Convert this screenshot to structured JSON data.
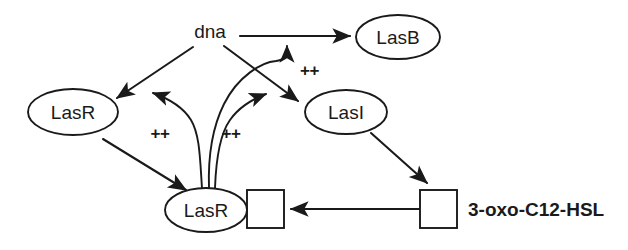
{
  "diagram": {
    "nodes": [
      {
        "id": "dna",
        "label": "dna",
        "shape": "text",
        "cx": 210,
        "cy": 31
      },
      {
        "id": "lasb",
        "label": "LasB",
        "shape": "ellipse",
        "cx": 398,
        "cy": 37
      },
      {
        "id": "lasr",
        "label": "LasR",
        "shape": "ellipse",
        "cx": 73,
        "cy": 112
      },
      {
        "id": "lasi",
        "label": "LasI",
        "shape": "ellipse",
        "cx": 346,
        "cy": 112
      },
      {
        "id": "lasr_complex",
        "label": "LasR",
        "shape": "ellipse-square",
        "cx": 206,
        "cy": 210
      },
      {
        "id": "hsl",
        "label": "3-oxo-C12-HSL",
        "shape": "square-label",
        "cx": 438,
        "cy": 209
      }
    ],
    "annotations": [
      {
        "id": "plus-dna",
        "label": "++",
        "x": 300,
        "y": 70
      },
      {
        "id": "plus-lasr",
        "label": "++",
        "x": 160,
        "y": 133
      },
      {
        "id": "plus-lasi",
        "label": "++",
        "x": 231,
        "y": 133
      }
    ],
    "edges": [
      {
        "id": "dna-to-lasb",
        "from": "dna",
        "to": "lasb",
        "kind": "straight-arrow"
      },
      {
        "id": "dna-to-lasr",
        "from": "dna",
        "to": "lasr",
        "kind": "straight-arrow"
      },
      {
        "id": "dna-to-lasi",
        "from": "dna",
        "to": "lasi",
        "kind": "straight-arrow"
      },
      {
        "id": "lasr-to-lasr-complex",
        "from": "lasr",
        "to": "lasr_complex",
        "kind": "straight-arrow"
      },
      {
        "id": "lasi-to-hsl",
        "from": "lasi",
        "to": "hsl",
        "kind": "straight-arrow"
      },
      {
        "id": "hsl-to-lasr-complex",
        "from": "hsl",
        "to": "lasr_complex",
        "kind": "straight-arrow"
      },
      {
        "id": "complex-activates-lasr",
        "from": "lasr_complex",
        "to": "lasr",
        "kind": "curved-arrow",
        "label": "++"
      },
      {
        "id": "complex-activates-dna",
        "from": "lasr_complex",
        "to": "dna",
        "kind": "curved-arrow",
        "label": "++"
      },
      {
        "id": "complex-activates-lasi",
        "from": "lasr_complex",
        "to": "lasi",
        "kind": "curved-arrow",
        "label": "++"
      }
    ],
    "colors": {
      "stroke": "#1a1a1a",
      "fill": "#ffffff",
      "background": "#ffffff"
    }
  }
}
